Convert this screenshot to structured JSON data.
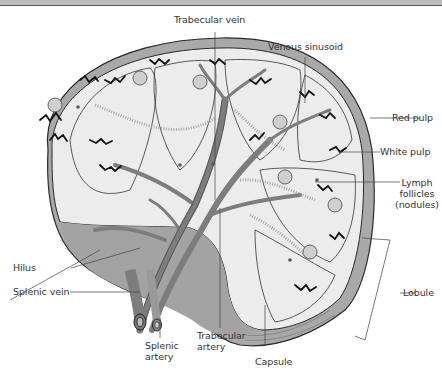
{
  "figure": {
    "colors": {
      "capsule_fill": "#a9a9a9",
      "parenchyma_fill": "#ececec",
      "vessel_fill": "#7d7d7d",
      "outline": "#2a2a2a",
      "label_text": "#333333",
      "top_bar": "#bdbdbd"
    }
  },
  "labels": {
    "trabecular_vein": "Trabecular vein",
    "venous_sinusoid": "Venous sinusoid",
    "red_pulp": "Red pulp",
    "white_pulp": "White pulp",
    "lymph_follicles_line1": "Lymph",
    "lymph_follicles_line2": "follicles",
    "lymph_follicles_line3": "(nodules)",
    "hilus": "Hilus",
    "splenic_vein": "Splenic vein",
    "lobule": "Lobule",
    "splenic_artery_line1": "Splenic",
    "splenic_artery_line2": "artery",
    "trabecular_artery_line1": "Trabecular",
    "trabecular_artery_line2": "artery",
    "capsule": "Capsule"
  }
}
